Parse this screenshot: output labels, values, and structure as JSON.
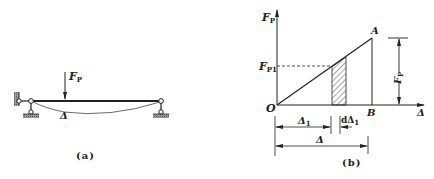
{
  "figure_a": {
    "caption": "(a)",
    "load_label": "F",
    "load_sub": "P",
    "deflection_label": "Δ"
  },
  "figure_b": {
    "caption": "(b)",
    "y_axis_label": "F",
    "y_axis_sub": "P",
    "x_axis_label": "Δ",
    "origin_label": "O",
    "point_a_label": "A",
    "point_b_label": "B",
    "fp1_label": "F",
    "fp1_sub": "P1",
    "fp_dim_label": "F",
    "fp_dim_sub": "P",
    "delta1_label": "Δ",
    "delta1_sub": "1",
    "d_delta1_label": "dΔ",
    "d_delta1_sub": "1",
    "delta_label": "Δ"
  },
  "colors": {
    "ink": "#222222",
    "hatch_fill": "#ffffff",
    "ground": "#888888"
  }
}
